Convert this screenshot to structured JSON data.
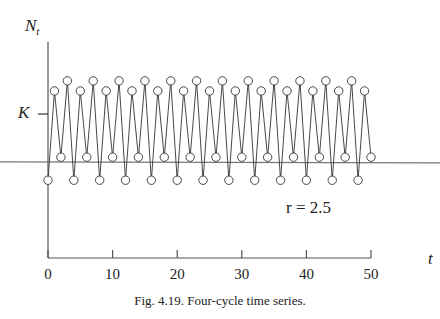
{
  "chart_data": {
    "type": "line",
    "title": "",
    "caption": "Fig. 4.19.  Four-cycle time series.",
    "xlabel": "t",
    "ylabel": "N_t",
    "ylabel_main": "N",
    "ylabel_sub": "t",
    "y_marker_label": "K",
    "annotation": "r = 2.5",
    "xlim": [
      0,
      50
    ],
    "xticks": [
      0,
      10,
      20,
      30,
      40,
      50
    ],
    "ylim": [
      0,
      1.5
    ],
    "K": 1.0,
    "reference_line_y": 0.667,
    "grid": false,
    "markers": "open-circle",
    "cycle_values": [
      0.54,
      1.16,
      0.7,
      1.23
    ],
    "x": [
      0,
      1,
      2,
      3,
      4,
      5,
      6,
      7,
      8,
      9,
      10,
      11,
      12,
      13,
      14,
      15,
      16,
      17,
      18,
      19,
      20,
      21,
      22,
      23,
      24,
      25,
      26,
      27,
      28,
      29,
      30,
      31,
      32,
      33,
      34,
      35,
      36,
      37,
      38,
      39,
      40,
      41,
      42,
      43,
      44,
      45,
      46,
      47,
      48,
      49,
      50
    ],
    "series": [
      {
        "name": "N_t",
        "values": [
          0.54,
          1.16,
          0.7,
          1.23,
          0.54,
          1.16,
          0.7,
          1.23,
          0.54,
          1.16,
          0.7,
          1.23,
          0.54,
          1.16,
          0.7,
          1.23,
          0.54,
          1.16,
          0.7,
          1.23,
          0.54,
          1.16,
          0.7,
          1.23,
          0.54,
          1.16,
          0.7,
          1.23,
          0.54,
          1.16,
          0.7,
          1.23,
          0.54,
          1.16,
          0.7,
          1.23,
          0.54,
          1.16,
          0.7,
          1.23,
          0.54,
          1.16,
          0.7,
          1.23,
          0.54,
          1.16,
          0.7,
          1.23,
          0.54,
          1.16,
          0.7
        ]
      }
    ]
  }
}
